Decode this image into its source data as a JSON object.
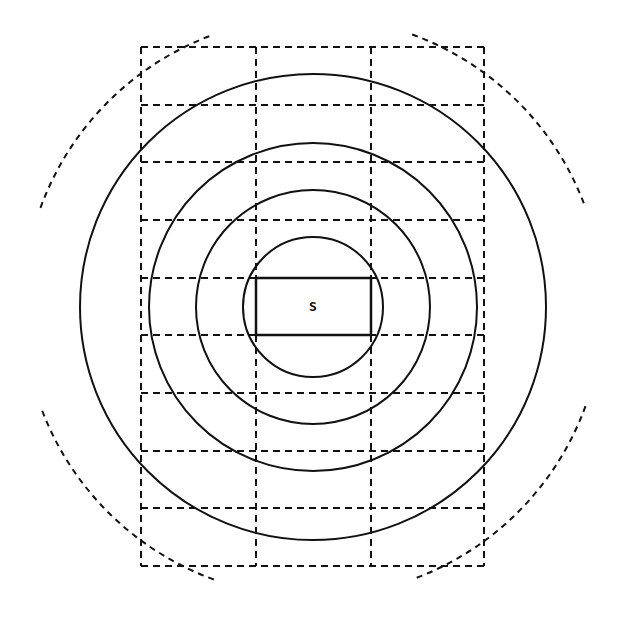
{
  "diagram": {
    "type": "concentric-rings-over-grid",
    "center": {
      "x": 313,
      "y": 307
    },
    "source": {
      "label": "S",
      "box": {
        "x1": 256,
        "y1": 278,
        "x2": 371,
        "y2": 335
      }
    },
    "grid": {
      "x_lines": [
        141,
        256,
        371,
        484
      ],
      "y_lines": [
        47,
        105,
        162,
        220,
        278,
        335,
        393,
        451,
        508,
        566
      ],
      "columns": 3,
      "rows": 9,
      "style": "dashed"
    },
    "rings": {
      "style": "solid",
      "radii": [
        70,
        117,
        164,
        233
      ]
    },
    "outer_arcs": {
      "style": "dashed",
      "radius": 290,
      "segments": [
        {
          "name": "top-left",
          "start_deg": 200,
          "end_deg": 250
        },
        {
          "name": "top-right",
          "start_deg": 290,
          "end_deg": 340
        },
        {
          "name": "bottom-right",
          "start_deg": 20,
          "end_deg": 70
        },
        {
          "name": "bottom-left",
          "start_deg": 110,
          "end_deg": 160
        }
      ]
    },
    "colors": {
      "ink": "#111111",
      "background": "#ffffff"
    }
  }
}
